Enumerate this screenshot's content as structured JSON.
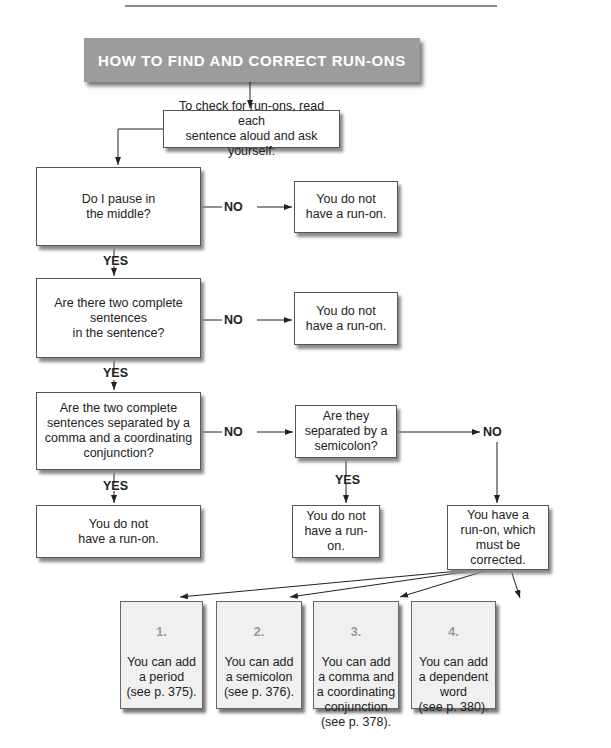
{
  "title": "HOW TO FIND AND CORRECT RUN-ONS",
  "intro": "To check for run-ons, read each\nsentence aloud and ask yourself:",
  "questions": [
    "Do I pause in\nthe middle?",
    "Are there two complete\nsentences\nin the sentence?",
    "Are the two complete\nsentences separated by a\ncomma and a coordinating\nconjunction?",
    "Are they\nseparated by a\nsemicolon?"
  ],
  "outcomes": {
    "not_runon": "You do not\nhave a run-on.",
    "runon": "You have a\nrun-on, which\nmust be corrected."
  },
  "labels": {
    "yes": "YES",
    "no": "NO"
  },
  "solutions": [
    {
      "number": "1.",
      "text": "You can add\na period\n(see p. 375)."
    },
    {
      "number": "2.",
      "text": "You can add\na semicolon\n(see p. 376)."
    },
    {
      "number": "3.",
      "text": "You can add\na comma and\na coordinating\nconjunction\n(see p. 378)."
    },
    {
      "number": "4.",
      "text": "You can add\na dependent\nword\n(see p. 380)."
    }
  ]
}
